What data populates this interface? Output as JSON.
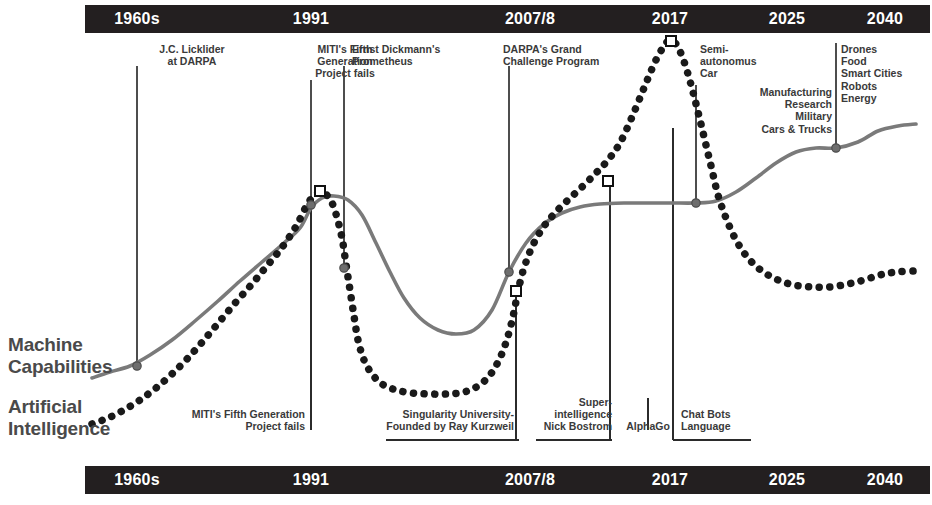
{
  "timeline": {
    "top_ticks": [
      {
        "label": "1960s",
        "x": 137
      },
      {
        "label": "1991",
        "x": 311
      },
      {
        "label": "2007/8",
        "x": 530
      },
      {
        "label": "2017",
        "x": 670
      },
      {
        "label": "2025",
        "x": 787
      },
      {
        "label": "2040",
        "x": 885
      }
    ],
    "bottom_ticks": [
      {
        "label": "1960s",
        "x": 137
      },
      {
        "label": "1991",
        "x": 311
      },
      {
        "label": "2007/8",
        "x": 530
      },
      {
        "label": "2017",
        "x": 670
      },
      {
        "label": "2025",
        "x": 787
      },
      {
        "label": "2040",
        "x": 885
      }
    ]
  },
  "series_labels": {
    "machine": "Machine\nCapabilities",
    "ai": "Artificial\nIntelligence"
  },
  "annotations_top": [
    {
      "id": "licklider",
      "text": "J.C. Licklider\nat DARPA",
      "align": "c",
      "x": 137,
      "y": 43,
      "w": 110,
      "lx": 137,
      "ly1": 66,
      "ly2": 366
    },
    {
      "id": "miti",
      "text": "MITI's Fifth\nGeneration\nProject fails",
      "align": "c",
      "x": 295,
      "y": 43,
      "w": 100,
      "lx": 311,
      "ly1": 80,
      "ly2": 196
    },
    {
      "id": "prometheus",
      "text": "Ernst Dickmann's\nPrometheus",
      "align": "l",
      "x": 352,
      "y": 43,
      "w": 130,
      "lx": 344,
      "ly1": 66,
      "ly2": 268
    },
    {
      "id": "darpa-gc",
      "text": "DARPA's Grand\nChallenge Program",
      "align": "l",
      "x": 503,
      "y": 43,
      "w": 140,
      "lx": 509,
      "ly1": 66,
      "ly2": 272
    },
    {
      "id": "semi-auto",
      "text": "Semi-\nautonomus\nCar",
      "align": "l",
      "x": 700,
      "y": 43,
      "w": 80,
      "lx": 696,
      "ly1": 85,
      "ly2": 203
    },
    {
      "id": "sectors",
      "text": "Manufacturing\nResearch\nMilitary\nCars & Trucks",
      "align": "r",
      "x": 740,
      "y": 86,
      "w": 92,
      "lx": 0,
      "ly1": 0,
      "ly2": 0
    },
    {
      "id": "future-apps",
      "text": "Drones\nFood\nSmart Cities\nRobots\nEnergy",
      "align": "l",
      "x": 841,
      "y": 43,
      "w": 92,
      "lx": 836,
      "ly1": 43,
      "ly2": 148
    }
  ],
  "annotations_bottom": [
    {
      "id": "miti-b",
      "text": "MITI's Fifth Generation\nProject fails",
      "align": "r",
      "x": 172,
      "y": 408,
      "w": 133,
      "lx": 311,
      "ly1": 196,
      "ly2": 430,
      "ux1": 0,
      "ux2": 0
    },
    {
      "id": "singularity",
      "text": "Singularity University-\nFounded by Ray Kurzweil",
      "align": "r",
      "x": 374,
      "y": 408,
      "w": 140,
      "lx": 516,
      "ly1": 291,
      "ly2": 440,
      "ux1": 386,
      "ux2": 519
    },
    {
      "id": "superintel",
      "text": "Super-\nintelligence\nNick Bostrom",
      "align": "r",
      "x": 540,
      "y": 396,
      "w": 72,
      "lx": 610,
      "ly1": 181,
      "ly2": 440,
      "ux1": 536,
      "ux2": 612
    },
    {
      "id": "alphago",
      "text": "AlphaGo",
      "align": "c",
      "x": 620,
      "y": 420,
      "w": 56,
      "lx": 648,
      "ly1": 398,
      "ly2": 430,
      "ux1": 0,
      "ux2": 0
    },
    {
      "id": "chatbots",
      "text": "Chat Bots\nLanguage",
      "align": "l",
      "x": 681,
      "y": 408,
      "w": 70,
      "lx": 673,
      "ly1": 128,
      "ly2": 440,
      "ux1": 673,
      "ux2": 751
    }
  ],
  "chart_data": {
    "type": "line",
    "xlabel": "",
    "ylabel": "",
    "x_axis_ticks": [
      "1960s",
      "1991",
      "2007/8",
      "2017",
      "2025",
      "2040"
    ],
    "grid": false,
    "legend": "inline-left",
    "series": [
      {
        "name": "Machine Capabilities",
        "style": "solid",
        "color": "#7a7a7a",
        "points": [
          [
            92,
            378
          ],
          [
            110,
            372
          ],
          [
            130,
            366
          ],
          [
            150,
            355
          ],
          [
            172,
            340
          ],
          [
            195,
            321
          ],
          [
            218,
            301
          ],
          [
            240,
            281
          ],
          [
            262,
            262
          ],
          [
            284,
            243
          ],
          [
            300,
            228
          ],
          [
            311,
            208
          ],
          [
            322,
            198
          ],
          [
            334,
            196
          ],
          [
            348,
            200
          ],
          [
            362,
            215
          ],
          [
            376,
            243
          ],
          [
            390,
            272
          ],
          [
            404,
            298
          ],
          [
            420,
            318
          ],
          [
            438,
            330
          ],
          [
            456,
            334
          ],
          [
            474,
            330
          ],
          [
            492,
            310
          ],
          [
            509,
            272
          ],
          [
            526,
            243
          ],
          [
            544,
            224
          ],
          [
            562,
            213
          ],
          [
            580,
            207
          ],
          [
            600,
            204
          ],
          [
            625,
            203
          ],
          [
            650,
            203
          ],
          [
            672,
            203
          ],
          [
            696,
            203
          ],
          [
            716,
            201
          ],
          [
            736,
            192
          ],
          [
            756,
            178
          ],
          [
            776,
            163
          ],
          [
            796,
            152
          ],
          [
            816,
            148
          ],
          [
            836,
            148
          ],
          [
            858,
            142
          ],
          [
            878,
            131
          ],
          [
            898,
            126
          ],
          [
            916,
            124
          ]
        ]
      },
      {
        "name": "Artificial Intelligence",
        "style": "dotted",
        "color": "#1a1a1a",
        "points": [
          [
            92,
            424
          ],
          [
            108,
            418
          ],
          [
            124,
            410
          ],
          [
            140,
            400
          ],
          [
            156,
            388
          ],
          [
            172,
            374
          ],
          [
            188,
            358
          ],
          [
            204,
            340
          ],
          [
            220,
            321
          ],
          [
            236,
            302
          ],
          [
            252,
            284
          ],
          [
            266,
            267
          ],
          [
            280,
            250
          ],
          [
            292,
            233
          ],
          [
            300,
            219
          ],
          [
            308,
            203
          ],
          [
            316,
            194
          ],
          [
            322,
            192
          ],
          [
            330,
            199
          ],
          [
            336,
            214
          ],
          [
            342,
            238
          ],
          [
            346,
            264
          ],
          [
            350,
            290
          ],
          [
            354,
            316
          ],
          [
            358,
            340
          ],
          [
            364,
            360
          ],
          [
            372,
            374
          ],
          [
            382,
            384
          ],
          [
            396,
            390
          ],
          [
            412,
            393
          ],
          [
            430,
            394
          ],
          [
            448,
            394
          ],
          [
            464,
            392
          ],
          [
            478,
            386
          ],
          [
            490,
            375
          ],
          [
            500,
            358
          ],
          [
            508,
            336
          ],
          [
            514,
            312
          ],
          [
            518,
            291
          ],
          [
            524,
            268
          ],
          [
            532,
            247
          ],
          [
            542,
            229
          ],
          [
            554,
            214
          ],
          [
            568,
            200
          ],
          [
            582,
            187
          ],
          [
            596,
            173
          ],
          [
            608,
            160
          ],
          [
            620,
            143
          ],
          [
            632,
            117
          ],
          [
            644,
            88
          ],
          [
            655,
            62
          ],
          [
            664,
            46
          ],
          [
            670,
            40
          ],
          [
            676,
            44
          ],
          [
            682,
            56
          ],
          [
            688,
            74
          ],
          [
            694,
            96
          ],
          [
            700,
            120
          ],
          [
            706,
            145
          ],
          [
            712,
            170
          ],
          [
            718,
            195
          ],
          [
            726,
            218
          ],
          [
            736,
            240
          ],
          [
            748,
            258
          ],
          [
            762,
            271
          ],
          [
            778,
            280
          ],
          [
            794,
            285
          ],
          [
            812,
            287
          ],
          [
            830,
            287
          ],
          [
            848,
            284
          ],
          [
            864,
            280
          ],
          [
            880,
            275
          ],
          [
            896,
            272
          ],
          [
            914,
            271
          ]
        ]
      }
    ],
    "markers_square": [
      {
        "x": 320,
        "y": 191,
        "series": "Artificial Intelligence",
        "label": "MITI's Fifth Generation Project fails"
      },
      {
        "x": 516,
        "y": 291,
        "series": "Artificial Intelligence",
        "label": "Singularity University- Founded by Ray Kurzweil"
      },
      {
        "x": 608,
        "y": 181,
        "series": "Artificial Intelligence",
        "label": "Super-intelligence Nick Bostrom"
      },
      {
        "x": 671,
        "y": 41,
        "series": "Artificial Intelligence",
        "label": "Chat Bots Language"
      }
    ],
    "markers_dot": [
      {
        "x": 137,
        "y": 366,
        "series": "Machine Capabilities",
        "label": "J.C. Licklider at DARPA"
      },
      {
        "x": 311,
        "y": 205,
        "series": "Machine Capabilities",
        "label": "MITI's Fifth Generation Project fails"
      },
      {
        "x": 344,
        "y": 268,
        "series": "Machine Capabilities",
        "label": "Ernst Dickmann's Prometheus"
      },
      {
        "x": 509,
        "y": 272,
        "series": "Machine Capabilities",
        "label": "DARPA's Grand Challenge Program"
      },
      {
        "x": 696,
        "y": 203,
        "series": "Machine Capabilities",
        "label": "Semi-autonomus Car"
      },
      {
        "x": 836,
        "y": 148,
        "series": "Machine Capabilities",
        "label": "Drones Food Smart Cities Robots Energy"
      }
    ]
  },
  "colors": {
    "bar_bg": "#231f20",
    "bar_text": "#ffffff",
    "machine_line": "#7a7a7a",
    "ai_line": "#1a1a1a",
    "annotation_text": "#3a3a3a",
    "series_label_text": "#4a4a4a",
    "page_bg": "#ffffff"
  }
}
